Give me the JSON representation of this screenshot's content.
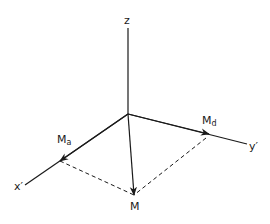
{
  "diagram": {
    "axes": {
      "z": {
        "label": "z"
      },
      "x": {
        "label": "x",
        "prime": "′"
      },
      "y": {
        "label": "y",
        "prime": "′"
      }
    },
    "vectors": {
      "Ma": {
        "main": "M",
        "sub": "a"
      },
      "Md": {
        "main": "M",
        "sub": "d"
      },
      "M": {
        "main": "M"
      }
    },
    "colors": {
      "stroke": "#1a1a1a",
      "background": "#ffffff"
    }
  }
}
